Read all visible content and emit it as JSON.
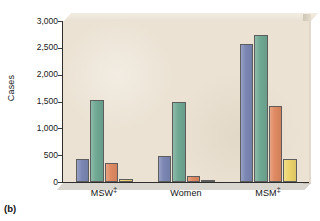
{
  "figure": {
    "caption": "(b)"
  },
  "chart_data": {
    "type": "bar",
    "title": "",
    "subtitle": "",
    "xlabel": "",
    "ylabel": "Cases",
    "categories": [
      "MSW‡",
      "Women",
      "MSM‡"
    ],
    "category_labels_plain": [
      "MSW",
      "Women",
      "MSM"
    ],
    "category_footnote_markers": [
      "‡",
      "",
      "‡"
    ],
    "series": [
      {
        "name": "series-1",
        "color": "#7b86b4",
        "values": [
          430,
          480,
          2580
        ]
      },
      {
        "name": "series-2",
        "color": "#6fa893",
        "values": [
          1520,
          1490,
          2740
        ]
      },
      {
        "name": "series-3",
        "color": "#e08a62",
        "values": [
          360,
          120,
          1420
        ]
      },
      {
        "name": "series-4",
        "color": "#ecd46a",
        "values": [
          60,
          40,
          420
        ]
      }
    ],
    "ylim": [
      0,
      3000
    ],
    "ytick_values": [
      0,
      500,
      1000,
      1500,
      2000,
      2500,
      3000
    ],
    "ytick_labels": [
      "0",
      "500",
      "1,000",
      "1,500",
      "2,000",
      "2,500",
      "3,000"
    ],
    "grid": false,
    "legend": null,
    "legend_position": "none",
    "panel_background": "#ebe2d3",
    "figure_background": "#ffffff"
  }
}
